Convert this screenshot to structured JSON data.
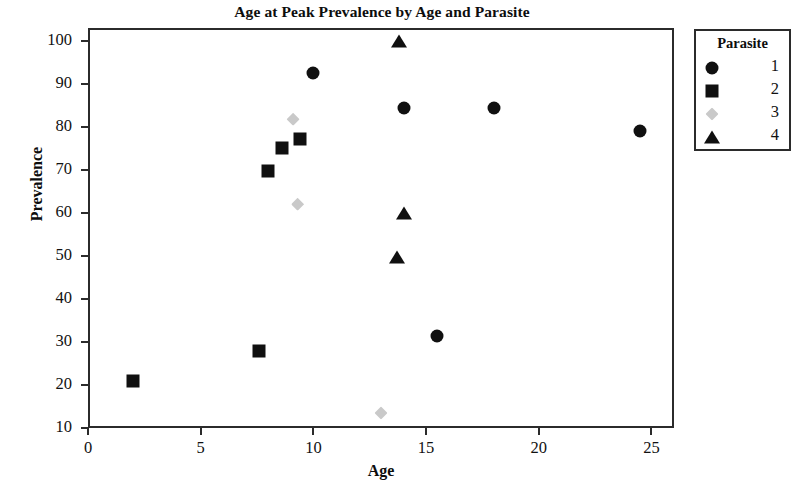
{
  "chart_data": {
    "type": "scatter",
    "title": "Age at Peak Prevalence by Age and Parasite",
    "xlabel": "Age",
    "ylabel": "Prevalence",
    "xlim": [
      0,
      26
    ],
    "ylim": [
      10,
      103
    ],
    "xticks": [
      0,
      5,
      10,
      15,
      20,
      25
    ],
    "yticks": [
      10,
      20,
      30,
      40,
      50,
      60,
      70,
      80,
      90,
      100
    ],
    "grid": false,
    "legend": {
      "title": "Parasite",
      "position": "right-outside",
      "entries": [
        {
          "label": "1",
          "marker": "circle",
          "color": "#101010"
        },
        {
          "label": "2",
          "marker": "square",
          "color": "#101010"
        },
        {
          "label": "3",
          "marker": "diamond",
          "color": "#c9c9c9"
        },
        {
          "label": "4",
          "marker": "triangle",
          "color": "#101010"
        }
      ]
    },
    "series": [
      {
        "name": "1",
        "marker": "circle",
        "color": "#101010",
        "points": [
          {
            "x": 10.0,
            "y": 92.5
          },
          {
            "x": 14.0,
            "y": 84.5
          },
          {
            "x": 18.0,
            "y": 84.5
          },
          {
            "x": 24.5,
            "y": 79.0
          },
          {
            "x": 15.5,
            "y": 31.3
          }
        ]
      },
      {
        "name": "2",
        "marker": "square",
        "color": "#101010",
        "points": [
          {
            "x": 9.4,
            "y": 77.2
          },
          {
            "x": 8.6,
            "y": 75.0
          },
          {
            "x": 8.0,
            "y": 69.8
          },
          {
            "x": 7.6,
            "y": 28.0
          },
          {
            "x": 2.0,
            "y": 21.0
          }
        ]
      },
      {
        "name": "3",
        "marker": "diamond",
        "color": "#c9c9c9",
        "points": [
          {
            "x": 9.1,
            "y": 81.8
          },
          {
            "x": 9.3,
            "y": 62.0
          },
          {
            "x": 13.0,
            "y": 13.5
          }
        ]
      },
      {
        "name": "4",
        "marker": "triangle",
        "color": "#101010",
        "points": [
          {
            "x": 13.8,
            "y": 100.0
          },
          {
            "x": 14.0,
            "y": 60.0
          },
          {
            "x": 13.7,
            "y": 49.8
          }
        ]
      }
    ]
  }
}
